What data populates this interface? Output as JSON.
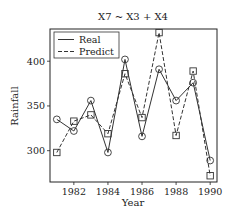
{
  "chart_data": {
    "type": "line",
    "title": "X7 ~ X3 + X4",
    "xlabel": "Year",
    "ylabel": "Rainfall",
    "x": [
      1981,
      1982,
      1983,
      1984,
      1985,
      1986,
      1987,
      1988,
      1989,
      1990
    ],
    "xticks": [
      1982,
      1984,
      1986,
      1988,
      1990
    ],
    "yticks": [
      300,
      350,
      400
    ],
    "xlim": [
      1980.6,
      1990.4
    ],
    "ylim": [
      265,
      436
    ],
    "grid": false,
    "legend_position": "upper left",
    "series": [
      {
        "name": "Real",
        "style": "solid",
        "marker": "circle",
        "values": [
          335,
          322,
          356,
          298,
          402,
          316,
          391,
          356,
          376,
          289
        ]
      },
      {
        "name": "Predict",
        "style": "dashed",
        "marker": "square",
        "values": [
          298,
          333,
          340,
          319,
          386,
          337,
          432,
          317,
          389,
          272
        ]
      }
    ]
  },
  "colors": {
    "line": "#333333",
    "frame": "#222222",
    "background": "#ffffff"
  }
}
